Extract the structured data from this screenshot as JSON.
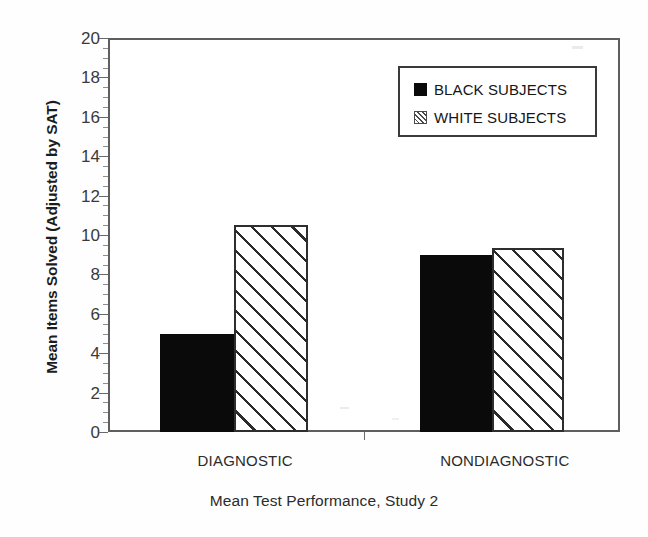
{
  "chart_data": {
    "type": "bar",
    "title": "",
    "caption": "Mean Test Performance, Study 2",
    "xlabel": "",
    "ylabel": "Mean Items Solved (Adjusted by SAT)",
    "categories": [
      "DIAGNOSTIC",
      "NONDIAGNOSTIC"
    ],
    "series": [
      {
        "name": "BLACK SUBJECTS",
        "fill": "solid",
        "color": "#0a0a0a",
        "values": [
          5.0,
          9.0
        ]
      },
      {
        "name": "WHITE SUBJECTS",
        "fill": "hatched",
        "color": "#ffffff",
        "values": [
          10.5,
          9.35
        ]
      }
    ],
    "ylim": [
      0,
      20
    ],
    "ytick_step": 2,
    "yticks": [
      0,
      2,
      4,
      6,
      8,
      10,
      12,
      14,
      16,
      18,
      20
    ],
    "ytick_labels": [
      "0",
      "2",
      "4",
      "6",
      "8",
      "10",
      "12",
      "14",
      "16",
      "18",
      "20"
    ],
    "yminor_step": 0.5,
    "grid": false,
    "legend_position": "top-right",
    "legend_entries": [
      "BLACK SUBJECTS",
      "WHITE SUBJECTS"
    ]
  },
  "legend": {
    "entries": [
      {
        "label": "BLACK SUBJECTS",
        "swatch": "solid-square-swatch"
      },
      {
        "label": "WHITE SUBJECTS",
        "swatch": "hatched-square-swatch"
      }
    ]
  },
  "axes": {
    "y_title": "Mean Items Solved (Adjusted by SAT)",
    "y_labels": [
      "20",
      "18",
      "16",
      "14",
      "12",
      "10",
      "8",
      "6",
      "4",
      "2",
      "0"
    ],
    "x_labels": [
      "DIAGNOSTIC",
      "NONDIAGNOSTIC"
    ]
  },
  "caption": "Mean Test Performance, Study 2"
}
